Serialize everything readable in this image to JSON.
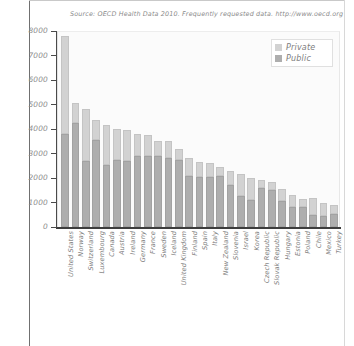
{
  "chart_data": {
    "type": "bar",
    "subtype": "stacked-vertical",
    "title": "Source: OECD Health Data 2010. Frequently requested data.  http://www.oecd.org",
    "xlabel": "",
    "ylabel": "",
    "ylim": [
      0,
      8000
    ],
    "ytick_step": 1000,
    "ytick_labels": [
      "8000",
      "7000",
      "6000",
      "5000",
      "4000",
      "3000",
      "2000",
      "1000",
      "0"
    ],
    "ytick_values": [
      8000,
      7000,
      6000,
      5000,
      4000,
      3000,
      2000,
      1000,
      0
    ],
    "grid": false,
    "legend_position": "top-right",
    "legend": [
      "Private",
      "Public"
    ],
    "colors": {
      "private": "#d2d2d2",
      "public": "#aeaeae",
      "axis": "#3d3d3d",
      "text": "#8a8a8a",
      "plot_background": "#fbfbfb"
    },
    "categories": [
      "United States",
      "Norway",
      "Switzerland",
      "Luxembourg",
      "Canada",
      "Austria",
      "Ireland",
      "Germany",
      "France",
      "Sweden",
      "Iceland",
      "United Kingdom",
      "Finland",
      "Spain",
      "Italy",
      "New Zealand",
      "Slovenia",
      "Israel",
      "Korea",
      "Czech Republic",
      "Slovak Republic",
      "Hungary",
      "Estonia",
      "Poland",
      "Chile",
      "Mexico",
      "Turkey"
    ],
    "series": [
      {
        "name": "Public",
        "values": [
          3800,
          4250,
          2700,
          3550,
          2550,
          2750,
          2700,
          2900,
          2900,
          2900,
          2800,
          2750,
          2100,
          2050,
          2050,
          2100,
          1700,
          1250,
          1100,
          1600,
          1500,
          1050,
          800,
          800,
          500,
          450,
          550
        ]
      },
      {
        "name": "Private",
        "values": [
          4000,
          800,
          2100,
          800,
          1600,
          1250,
          1250,
          900,
          850,
          600,
          700,
          450,
          700,
          600,
          550,
          350,
          600,
          900,
          900,
          300,
          350,
          500,
          500,
          350,
          700,
          550,
          350
        ]
      }
    ],
    "totals": [
      7800,
      5050,
      4800,
      4350,
      4150,
      4000,
      3950,
      3800,
      3750,
      3500,
      3500,
      3200,
      2800,
      2650,
      2600,
      2450,
      2300,
      2150,
      2000,
      1900,
      1850,
      1550,
      1300,
      1150,
      1200,
      1000,
      900
    ]
  }
}
